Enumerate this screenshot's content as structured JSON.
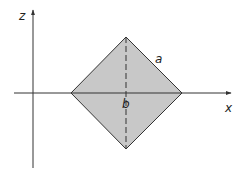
{
  "diagram": {
    "axes": {
      "horizontal_label": "x",
      "vertical_label": "z"
    },
    "shape": {
      "type": "square rotated 45° (diamond)",
      "side_label": "a",
      "center_label": "b",
      "fill_color": "#c8c8c8",
      "stroke_color": "#333333"
    },
    "colors": {
      "axis": "#333333",
      "background": "#ffffff"
    }
  }
}
